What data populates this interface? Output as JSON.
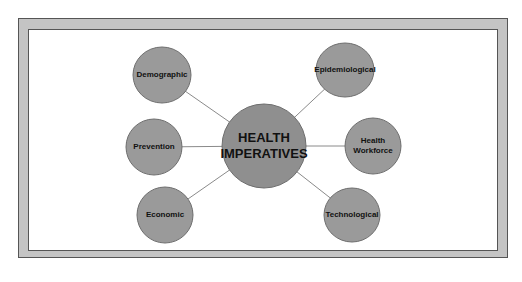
{
  "diagram": {
    "type": "mind-map",
    "center": {
      "label_line1": "HEALTH",
      "label_line2": "IMPERATIVES"
    },
    "nodes": [
      {
        "id": "demographic",
        "label_line1": "Demographic",
        "label_line2": ""
      },
      {
        "id": "prevention",
        "label_line1": "Prevention",
        "label_line2": ""
      },
      {
        "id": "economic",
        "label_line1": "Economic",
        "label_line2": ""
      },
      {
        "id": "epidemiological",
        "label_line1": "Epidemiological",
        "label_line2": ""
      },
      {
        "id": "health-workforce",
        "label_line1": "Health",
        "label_line2": "Workforce"
      },
      {
        "id": "technological",
        "label_line1": "Technological",
        "label_line2": ""
      }
    ],
    "colors": {
      "node_fill": "#9a9a9a",
      "node_stroke": "#6e6e6e",
      "line": "#8a8a8a",
      "frame": "#c4c4c4"
    }
  }
}
